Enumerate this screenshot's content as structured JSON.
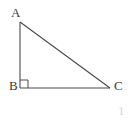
{
  "figure": {
    "kind": "right-triangle-diagram",
    "background_color": "#ffffff",
    "stroke_color": "#4a4a4a",
    "label_color": "#3b3b3b",
    "width": 132,
    "height": 122
  },
  "vertices": {
    "a": {
      "label": "A",
      "x": 20,
      "y": 22
    },
    "b": {
      "label": "B",
      "x": 20,
      "y": 88
    },
    "c": {
      "label": "C",
      "x": 110,
      "y": 88
    }
  },
  "sides": [
    {
      "name": "leg-ab",
      "from": "A",
      "to": "B"
    },
    {
      "name": "leg-bc",
      "from": "B",
      "to": "C"
    },
    {
      "name": "hypotenuse-ac",
      "from": "A",
      "to": "C"
    }
  ],
  "right_angle": {
    "at": "B",
    "marker": "square",
    "size": 8
  },
  "artifacts": {
    "corner_mark": "1"
  }
}
